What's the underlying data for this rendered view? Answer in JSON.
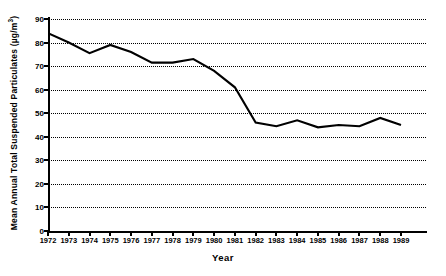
{
  "chart_data": {
    "type": "line",
    "title": "",
    "xlabel": "Year",
    "ylabel": "Mean Annual Total Suspended Particulates (µg/m³)",
    "ylabel_main": "Mean Annual Total Suspended Particulates (µg/m",
    "ylabel_sup": "3",
    "ylabel_close": ")",
    "xlim": [
      1972,
      1989
    ],
    "ylim": [
      0,
      90
    ],
    "grid": true,
    "grid_style": "dotted-horizontal",
    "legend": "none",
    "line_color": "#000000",
    "x": [
      1972,
      1973,
      1974,
      1975,
      1976,
      1977,
      1978,
      1979,
      1980,
      1981,
      1982,
      1983,
      1984,
      1985,
      1986,
      1987,
      1988,
      1989
    ],
    "values": [
      84,
      80,
      75.5,
      79,
      76,
      71.5,
      71.5,
      73,
      68,
      61,
      46,
      44.5,
      47,
      44,
      45,
      44.5,
      48,
      45
    ],
    "categories": [
      "1972",
      "1973",
      "1974",
      "1975",
      "1976",
      "1977",
      "1978",
      "1979",
      "1980",
      "1981",
      "1982",
      "1983",
      "1984",
      "1985",
      "1986",
      "1987",
      "1988",
      "1989"
    ],
    "yticks": [
      0,
      10,
      20,
      30,
      40,
      50,
      60,
      70,
      80,
      90
    ],
    "ytick_labels": [
      "0",
      "10",
      "20",
      "30",
      "40",
      "50",
      "60",
      "70",
      "80",
      "90"
    ],
    "xticks": [
      1972,
      1973,
      1974,
      1975,
      1976,
      1977,
      1978,
      1979,
      1980,
      1981,
      1982,
      1983,
      1984,
      1985,
      1986,
      1987,
      1988,
      1989
    ],
    "xtick_labels": [
      "1972",
      "1973",
      "1974",
      "1975",
      "1976",
      "1977",
      "1978",
      "1979",
      "1980",
      "1981",
      "1982",
      "1983",
      "1984",
      "1985",
      "1986",
      "1987",
      "1988",
      "1989"
    ]
  }
}
